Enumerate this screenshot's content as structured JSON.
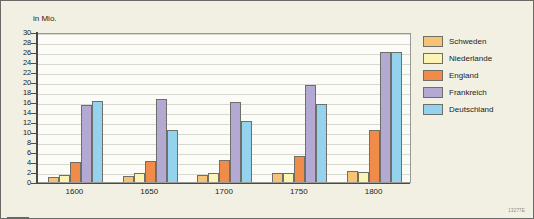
{
  "chart_data": {
    "type": "bar",
    "title": "",
    "subtitle": "",
    "ylabel": "in Mio.",
    "xlabel": "",
    "categories": [
      "1600",
      "1650",
      "1700",
      "1750",
      "1800"
    ],
    "ylim": [
      0,
      30
    ],
    "ytick_step": 2,
    "yticks": [
      30,
      28,
      26,
      24,
      22,
      20,
      18,
      16,
      14,
      12,
      10,
      8,
      6,
      4,
      2,
      0
    ],
    "grid": true,
    "legend_position": "right",
    "series": [
      {
        "name": "Schweden",
        "color": "#f5c276",
        "values": [
          1.0,
          1.2,
          1.4,
          1.8,
          2.3
        ]
      },
      {
        "name": "Niederlande",
        "color": "#fbf4b4",
        "values": [
          1.5,
          1.9,
          1.9,
          1.9,
          2.1
        ]
      },
      {
        "name": "England",
        "color": "#f08b4a",
        "values": [
          4.0,
          4.3,
          4.4,
          5.3,
          10.4
        ]
      },
      {
        "name": "Frankreich",
        "color": "#b4a9d2",
        "values": [
          15.5,
          16.6,
          16.0,
          19.5,
          26.0
        ]
      },
      {
        "name": "Deutschland",
        "color": "#94d2ee",
        "values": [
          16.3,
          10.5,
          12.2,
          15.6,
          26.0
        ]
      }
    ]
  },
  "axis": {
    "y_title": "in Mio."
  },
  "footer": {
    "source_code": "13277E"
  }
}
